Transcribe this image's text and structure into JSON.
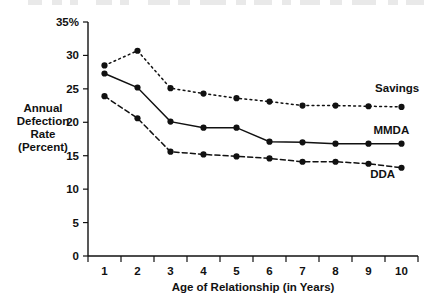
{
  "chart_data": {
    "type": "line",
    "title": "",
    "xlabel": "Age of Relationship (in Years)",
    "ylabel": "Annual Defection Rate (Percent)",
    "ylabel_lines": [
      "Annual",
      "Defection",
      "Rate",
      "(Percent)"
    ],
    "x": [
      1,
      2,
      3,
      4,
      5,
      6,
      7,
      8,
      9,
      10
    ],
    "categories": [
      "1",
      "2",
      "3",
      "4",
      "5",
      "6",
      "7",
      "8",
      "9",
      "10"
    ],
    "xtick_labels": [
      "1",
      "2",
      "3",
      "4",
      "5",
      "6",
      "7",
      "8",
      "9",
      "10"
    ],
    "ytick_labels": [
      "0",
      "5",
      "10",
      "15",
      "20",
      "25",
      "30",
      "35%"
    ],
    "ytick_values": [
      0,
      5,
      10,
      15,
      20,
      25,
      30,
      35
    ],
    "ylim": [
      0,
      35
    ],
    "xlim": [
      0.5,
      10.5
    ],
    "grid": false,
    "legend_position": "inline-right",
    "series": [
      {
        "name": "Savings",
        "label": "Savings",
        "style": "dotted",
        "color": "#111111",
        "values": [
          28.5,
          30.7,
          25.1,
          24.3,
          23.6,
          23.1,
          22.5,
          22.5,
          22.4,
          22.3
        ]
      },
      {
        "name": "MMDA",
        "label": "MMDA",
        "style": "solid",
        "color": "#111111",
        "values": [
          27.3,
          25.2,
          20.1,
          19.2,
          19.2,
          17.1,
          17.0,
          16.8,
          16.8,
          16.8
        ]
      },
      {
        "name": "DDA",
        "label": "DDA",
        "style": "dashed",
        "color": "#111111",
        "values": [
          23.9,
          20.6,
          15.6,
          15.2,
          14.9,
          14.6,
          14.1,
          14.1,
          13.8,
          13.2
        ]
      }
    ]
  },
  "axes": {
    "y_axis_name": "annual-defection-rate-axis",
    "x_axis_name": "age-of-relationship-axis"
  }
}
